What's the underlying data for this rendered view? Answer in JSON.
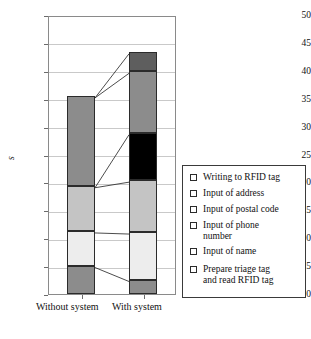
{
  "chart_data": {
    "type": "bar",
    "subtype": "stacked-bar",
    "title": "",
    "xlabel": "",
    "ylabel": "s",
    "ylim": [
      0,
      50
    ],
    "ytick_values": [
      0,
      5,
      10,
      15,
      20,
      25,
      30,
      35,
      40,
      45,
      50
    ],
    "ytick_labels": [
      "0",
      "5",
      "10",
      "15",
      "20",
      "25",
      "30",
      "35",
      "40",
      "45",
      "50"
    ],
    "grid": true,
    "legend_position": "right",
    "categories": [
      "Without system",
      "With system"
    ],
    "series": [
      {
        "name": "Prepare triage tag and read RFID tag",
        "color": "#8c8c8c",
        "values": [
          5.1,
          2.6
        ]
      },
      {
        "name": "Input of name",
        "color": "#ededed",
        "values": [
          6.2,
          8.5
        ]
      },
      {
        "name": "Input of phone number",
        "color": "#c4c4c4",
        "values": [
          8.1,
          9.3
        ]
      },
      {
        "name": "Input of postal code",
        "color": "#000000",
        "values": [
          0.0,
          8.5
        ]
      },
      {
        "name": "Input of address",
        "color": "#8c8c8c",
        "values": [
          16.1,
          11.0
        ]
      },
      {
        "name": "Writing to RFID tag",
        "color": "#5e5e5e",
        "values": [
          0.0,
          3.5
        ]
      }
    ],
    "totals": [
      35.5,
      43.4
    ],
    "stack_tops": {
      "Without system": [
        5.1,
        11.3,
        19.4,
        19.4,
        35.5,
        35.5
      ],
      "With system": [
        2.6,
        11.1,
        20.4,
        28.9,
        39.9,
        43.4
      ]
    }
  },
  "axis": {
    "y_label": "s",
    "y_ticks": [
      "50",
      "45",
      "40",
      "35",
      "30",
      "25",
      "20",
      "15",
      "10",
      "5",
      "0"
    ],
    "x_ticks": [
      "Without system",
      "With system"
    ]
  },
  "legend": {
    "items": [
      {
        "label": "Writing to RFID tag",
        "color": "#5e5e5e"
      },
      {
        "label": "Input of address",
        "color": "#8c8c8c"
      },
      {
        "label": "Input of postal code",
        "color": "#000000"
      },
      {
        "label": "Input of phone\nnumber",
        "color": "#c4c4c4"
      },
      {
        "label": "Input of name",
        "color": "#ededed"
      },
      {
        "label": "Prepare triage tag\nand read RFID tag",
        "color": "#8c8c8c"
      }
    ]
  }
}
